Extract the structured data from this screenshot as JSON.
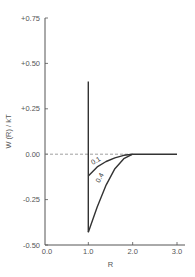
{
  "chart_data": {
    "type": "line",
    "title": "",
    "xlabel": "R",
    "ylabel": "W (R) / kT",
    "xlim": [
      0.0,
      3.0
    ],
    "ylim": [
      -0.5,
      0.75
    ],
    "x_ticks": [
      "0.0",
      "1.0",
      "2.0",
      "3.0"
    ],
    "y_ticks": [
      "+0.75",
      "+0.50",
      "+0.25",
      "0.00",
      "-0.25",
      "-0.50"
    ],
    "grid": false,
    "reference_line": {
      "y": 0.0,
      "style": "dashed",
      "x_range": [
        0.0,
        2.0
      ]
    },
    "series": [
      {
        "name": "hard-core wall",
        "points": [
          [
            1.0,
            0.4
          ],
          [
            1.0,
            -0.43
          ]
        ]
      },
      {
        "name": "0.1",
        "label": "0.1",
        "points": [
          [
            1.0,
            -0.12
          ],
          [
            1.2,
            -0.07
          ],
          [
            1.4,
            -0.04
          ],
          [
            1.6,
            -0.02
          ],
          [
            1.8,
            -0.006
          ],
          [
            2.0,
            0.0
          ]
        ]
      },
      {
        "name": "0.4",
        "label": "0.4",
        "points": [
          [
            1.0,
            -0.43
          ],
          [
            1.2,
            -0.29
          ],
          [
            1.4,
            -0.17
          ],
          [
            1.6,
            -0.08
          ],
          [
            1.8,
            -0.025
          ],
          [
            2.0,
            0.0
          ]
        ]
      },
      {
        "name": "tail",
        "points": [
          [
            2.0,
            0.0
          ],
          [
            3.0,
            0.0
          ]
        ]
      }
    ]
  }
}
